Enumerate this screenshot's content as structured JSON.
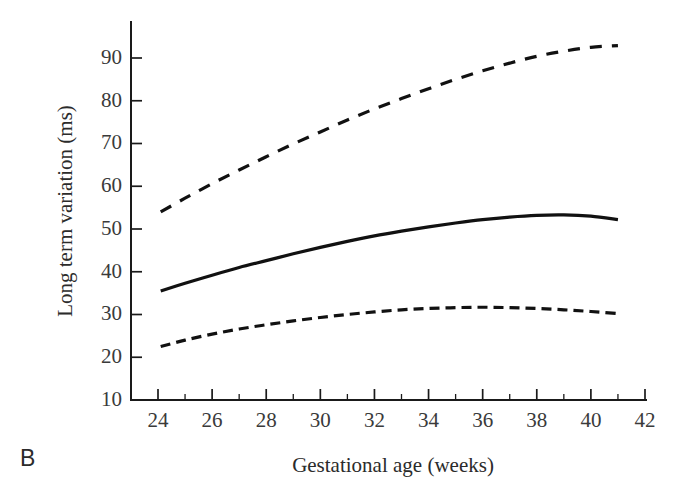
{
  "panel": {
    "label": "B"
  },
  "chart_data": {
    "type": "line",
    "title": "",
    "xlabel": "Gestational age (weeks)",
    "ylabel": "Long term variation (ms)",
    "xlim": [
      23,
      42
    ],
    "ylim": [
      10,
      95
    ],
    "xticks": [
      24,
      26,
      28,
      30,
      32,
      34,
      36,
      38,
      40,
      42
    ],
    "xticklabels": [
      "24",
      "26",
      "28",
      "30",
      "32",
      "34",
      "36",
      "38",
      "40",
      "42"
    ],
    "xminorticks": [
      25,
      27,
      29,
      31,
      33,
      35,
      37,
      39,
      41
    ],
    "yticks": [
      10,
      20,
      30,
      40,
      50,
      60,
      70,
      80,
      90
    ],
    "yticklabels": [
      "10",
      "20",
      "30",
      "40",
      "50",
      "60",
      "70",
      "80",
      "90"
    ],
    "grid": false,
    "legend": null,
    "x": [
      24.1,
      25,
      26,
      27,
      28,
      29,
      30,
      31,
      32,
      33,
      34,
      35,
      36,
      37,
      38,
      39,
      40,
      41
    ],
    "series": [
      {
        "name": "upper centile",
        "linestyle": "dashed-long",
        "color": "#111111",
        "values": [
          54.0,
          57.2,
          60.6,
          63.8,
          66.9,
          69.9,
          72.7,
          75.5,
          78.1,
          80.5,
          82.8,
          85.0,
          87.0,
          88.8,
          90.4,
          91.6,
          92.5,
          92.9
        ]
      },
      {
        "name": "median",
        "linestyle": "solid",
        "color": "#111111",
        "values": [
          35.5,
          37.3,
          39.2,
          41.0,
          42.6,
          44.2,
          45.7,
          47.1,
          48.4,
          49.5,
          50.5,
          51.4,
          52.2,
          52.8,
          53.2,
          53.3,
          53.0,
          52.2
        ]
      },
      {
        "name": "lower centile",
        "linestyle": "dashed-short",
        "color": "#111111",
        "values": [
          22.5,
          24.0,
          25.4,
          26.6,
          27.6,
          28.5,
          29.3,
          30.0,
          30.6,
          31.1,
          31.4,
          31.6,
          31.7,
          31.6,
          31.4,
          31.1,
          30.7,
          30.2
        ]
      }
    ]
  }
}
